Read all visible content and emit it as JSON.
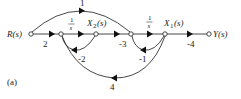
{
  "figure": {
    "caption": "(a)",
    "type": "signal-flow-graph"
  },
  "nodes": {
    "input": {
      "label": "R(s)"
    },
    "a": {
      "label": ""
    },
    "x2": {
      "label": "X",
      "sub": "2",
      "suffix": "(s)"
    },
    "b": {
      "label": ""
    },
    "x1": {
      "label": "X",
      "sub": "1",
      "suffix": "(s)"
    },
    "output": {
      "label": "Y(s)"
    }
  },
  "branches": {
    "r_to_a": {
      "gain": "2"
    },
    "a_to_x2": {
      "num": "1",
      "den": "s"
    },
    "x2_to_b": {
      "gain": "-3"
    },
    "b_to_x1": {
      "num": "1",
      "den": "s"
    },
    "x1_to_y": {
      "gain": "-4"
    },
    "x2_to_a_feedback": {
      "gain": "-2"
    },
    "x1_to_b_feedback": {
      "gain": "-1"
    },
    "x1_to_a_feedback": {
      "gain": "4"
    },
    "r_to_b_feedforward": {
      "gain": "1"
    }
  }
}
